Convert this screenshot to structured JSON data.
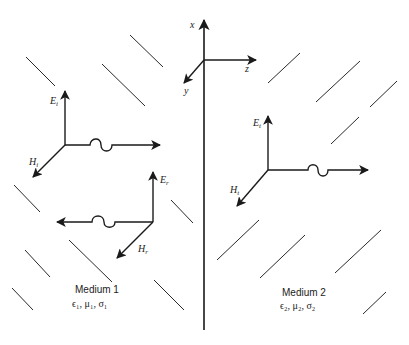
{
  "figure": {
    "colors": {
      "ink": "#1a1a1a",
      "background": "#ffffff"
    }
  },
  "axes": {
    "x_label": "x",
    "y_label": "y",
    "z_label": "z"
  },
  "incident_wave": {
    "e_label": "E",
    "e_sub": "i",
    "h_label": "H",
    "h_sub": "i",
    "direction": "+z"
  },
  "reflected_wave": {
    "e_label": "E",
    "e_sub": "r",
    "h_label": "H",
    "h_sub": "r",
    "direction": "-z"
  },
  "transmitted_wave": {
    "e_label": "E",
    "e_sub": "t",
    "h_label": "H",
    "h_sub": "t",
    "direction": "+z"
  },
  "medium1": {
    "title": "Medium 1",
    "params": "ϵ₁, μ₁, σ₁"
  },
  "medium2": {
    "title": "Medium 2",
    "params": "ϵ₂, μ₂, σ₂"
  }
}
